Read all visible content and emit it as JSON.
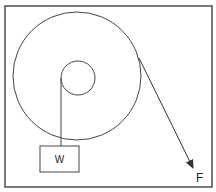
{
  "diagram": {
    "type": "wheel-and-axle",
    "colors": {
      "stroke": "#333333",
      "background": "#ffffff"
    },
    "frame": {
      "x": 5,
      "y": 6,
      "width": 207,
      "height": 181
    },
    "outer_wheel": {
      "cx": 77,
      "cy": 76,
      "r": 64
    },
    "inner_axle": {
      "cx": 78,
      "cy": 78,
      "r": 17
    },
    "load": {
      "label": "W",
      "x": 40,
      "y": 146,
      "width": 39,
      "height": 26
    },
    "force": {
      "label": "F",
      "from": [
        139,
        58
      ],
      "to": [
        193,
        168
      ]
    }
  }
}
